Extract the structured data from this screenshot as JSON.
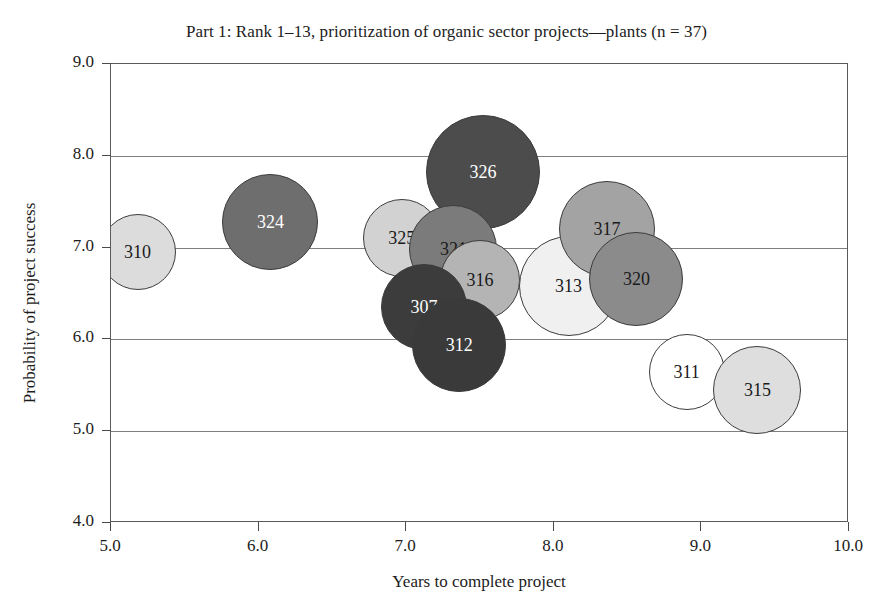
{
  "chart_data": {
    "type": "scatter",
    "title": "Part 1: Rank 1–13, prioritization of organic sector projects—plants (n = 37)",
    "xlabel": "Years to complete project",
    "ylabel": "Probability of project success",
    "xlim": [
      5.0,
      10.0
    ],
    "ylim": [
      4.0,
      9.0
    ],
    "xticks": [
      "5.0",
      "6.0",
      "7.0",
      "8.0",
      "9.0",
      "10.0"
    ],
    "yticks": [
      "4.0",
      "5.0",
      "6.0",
      "7.0",
      "8.0",
      "9.0"
    ],
    "grid": "horizontal",
    "legend": "none",
    "points": [
      {
        "label": "310",
        "x": 5.18,
        "y": 6.95,
        "r": 38,
        "fill": "#dcdcdc",
        "text_color": "#1a1a1a"
      },
      {
        "label": "324",
        "x": 6.08,
        "y": 7.28,
        "r": 48,
        "fill": "#6e6e6e",
        "text_color": "#ffffff"
      },
      {
        "label": "325",
        "x": 6.97,
        "y": 7.1,
        "r": 39,
        "fill": "#d2d2d2",
        "text_color": "#1a1a1a"
      },
      {
        "label": "326",
        "x": 7.52,
        "y": 7.82,
        "r": 57,
        "fill": "#4c4c4c",
        "text_color": "#ffffff"
      },
      {
        "label": "321",
        "x": 7.32,
        "y": 6.98,
        "r": 44,
        "fill": "#7b7b7b",
        "text_color": "#1a1a1a"
      },
      {
        "label": "316",
        "x": 7.5,
        "y": 6.65,
        "r": 40,
        "fill": "#b4b4b4",
        "text_color": "#1a1a1a"
      },
      {
        "label": "307",
        "x": 7.12,
        "y": 6.35,
        "r": 43,
        "fill": "#3c3c3c",
        "text_color": "#ffffff"
      },
      {
        "label": "312",
        "x": 7.36,
        "y": 5.94,
        "r": 47,
        "fill": "#3a3a3a",
        "text_color": "#ffffff"
      },
      {
        "label": "313",
        "x": 8.1,
        "y": 6.58,
        "r": 50,
        "fill": "#f0f0f0",
        "text_color": "#1a1a1a"
      },
      {
        "label": "317",
        "x": 8.36,
        "y": 7.2,
        "r": 48,
        "fill": "#a3a3a3",
        "text_color": "#1a1a1a"
      },
      {
        "label": "320",
        "x": 8.56,
        "y": 6.66,
        "r": 47,
        "fill": "#8b8b8b",
        "text_color": "#1a1a1a"
      },
      {
        "label": "311",
        "x": 8.9,
        "y": 5.65,
        "r": 38,
        "fill": "#ffffff",
        "text_color": "#1a1a1a"
      },
      {
        "label": "315",
        "x": 9.38,
        "y": 5.45,
        "r": 44,
        "fill": "#dedede",
        "text_color": "#1a1a1a"
      }
    ]
  }
}
